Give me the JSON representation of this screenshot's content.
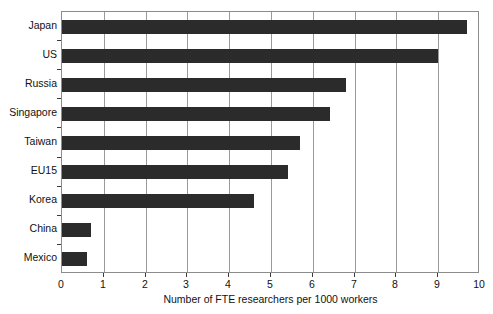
{
  "chart_data": {
    "type": "bar",
    "orientation": "horizontal",
    "title": "",
    "xlabel": "Number of FTE researchers per 1000 workers",
    "ylabel": "",
    "xlim": [
      0,
      10
    ],
    "xticks": [
      0,
      1,
      2,
      3,
      4,
      5,
      6,
      7,
      8,
      9,
      10
    ],
    "xtick_labels": [
      "0",
      "1",
      "2",
      "3",
      "4",
      "5",
      "6",
      "7",
      "8",
      "9",
      "10"
    ],
    "grid": true,
    "grid_axis": "x",
    "legend": false,
    "bar_color": "#2b2b2b",
    "frame_color": "#8c8c8c",
    "gridline_color": "#9a9a9a",
    "categories": [
      "Japan",
      "US",
      "Russia",
      "Singapore",
      "Taiwan",
      "EU15",
      "Korea",
      "China",
      "Mexico"
    ],
    "values": [
      9.7,
      9.0,
      6.8,
      6.4,
      5.7,
      5.4,
      4.6,
      0.7,
      0.6
    ]
  }
}
